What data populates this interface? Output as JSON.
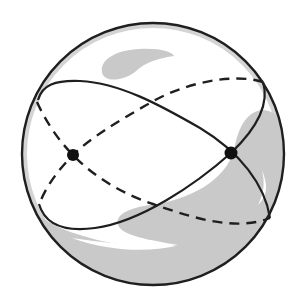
{
  "diagram": {
    "title": "Sphere with two intersecting great circles",
    "colors": {
      "background": "#ffffff",
      "outline": "#1f1f1f",
      "shade": "#c9c9c9",
      "highlight": "#ffffff",
      "point": "#111111"
    },
    "sphere": {
      "cx": 153,
      "cy": 154,
      "r": 131
    },
    "points": [
      {
        "id": "left-antipode",
        "x": 73,
        "y": 155
      },
      {
        "id": "right-antipode",
        "x": 231,
        "y": 153
      }
    ],
    "great_circles": [
      {
        "id": "circle-1",
        "front": "solid",
        "back": "dashed"
      },
      {
        "id": "circle-2",
        "front": "solid",
        "back": "dashed"
      }
    ]
  }
}
